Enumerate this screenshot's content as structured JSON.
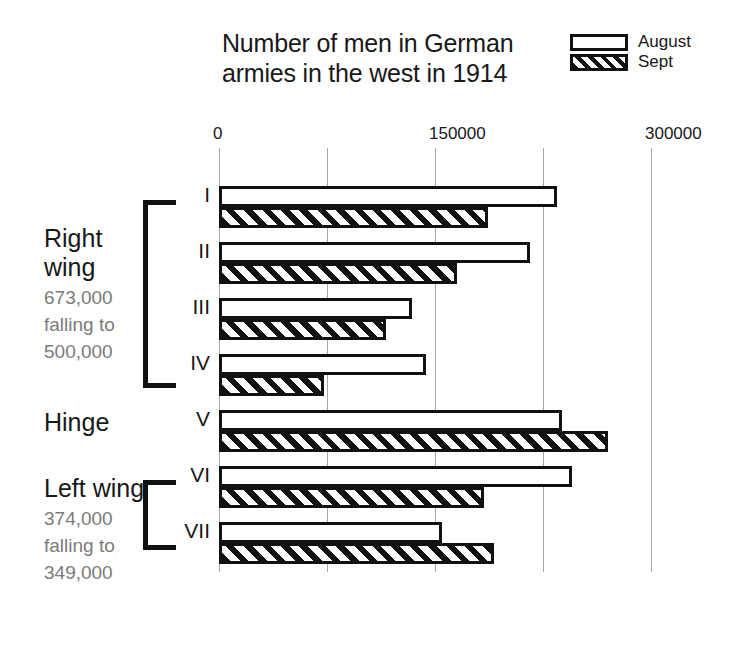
{
  "chart_data": {
    "type": "bar",
    "orientation": "horizontal",
    "title": "Number of men in German armies in the west in 1914",
    "title_lines": [
      "Number of men in German",
      "armies in the west in 1914"
    ],
    "xlabel": "",
    "ylabel": "",
    "xlim": [
      0,
      300000
    ],
    "xticks": [
      0,
      150000,
      300000
    ],
    "xtick_labels": [
      "0",
      "150000",
      "300000"
    ],
    "minor_gridlines": [
      75000,
      225000
    ],
    "grid": true,
    "legend_position": "top-right",
    "categories": [
      "I",
      "II",
      "III",
      "IV",
      "V",
      "VI",
      "VII"
    ],
    "series": [
      {
        "name": "August",
        "values": [
          235000,
          216000,
          134000,
          144000,
          238000,
          245000,
          155000
        ]
      },
      {
        "name": "Sept",
        "values": [
          187000,
          165000,
          116000,
          73000,
          270000,
          184000,
          191000
        ]
      }
    ],
    "annotations": [
      {
        "label": "Right wing",
        "note": [
          "673,000",
          "falling to",
          "500,000"
        ],
        "armies": [
          "I",
          "II",
          "III",
          "IV"
        ]
      },
      {
        "label": "Hinge",
        "note": [],
        "armies": [
          "V"
        ]
      },
      {
        "label": "Left wing",
        "note": [
          "374,000",
          "falling to",
          "349,000"
        ],
        "armies": [
          "VI",
          "VII"
        ]
      }
    ]
  },
  "legend": {
    "items": [
      {
        "label": "August",
        "pattern": "solid-outline"
      },
      {
        "label": "Sept",
        "pattern": "diagonal-hatch"
      }
    ]
  },
  "colors": {
    "ink": "#111111",
    "text": "#181818",
    "muted_text": "#7b7b7b",
    "gridline": "#a6a6a6",
    "background": "#ffffff"
  }
}
